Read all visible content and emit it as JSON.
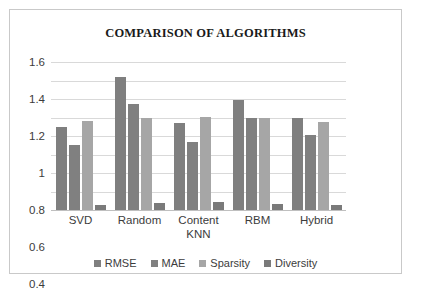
{
  "chart_data": {
    "type": "bar",
    "title": "COMPARISON OF ALGORITHMS",
    "xlabel": "",
    "ylabel": "",
    "ylim": [
      0,
      1.6
    ],
    "grid": true,
    "legend_position": "bottom",
    "categories": [
      "SVD",
      "Random",
      "Content KNN",
      "RBM",
      "Hybrid"
    ],
    "category_lines": [
      [
        "SVD"
      ],
      [
        "Random"
      ],
      [
        "Content",
        "KNN"
      ],
      [
        "RBM"
      ],
      [
        "Hybrid"
      ]
    ],
    "ytick_labels": [
      "1.6",
      "1.4",
      "1.2",
      "1",
      "0.8",
      "0.6",
      "0.4",
      "0.2",
      "0"
    ],
    "ytick_values": [
      1.6,
      1.4,
      1.2,
      1.0,
      0.8,
      0.6,
      0.4,
      0.2,
      0
    ],
    "series": [
      {
        "name": "RMSE",
        "color": "#7f7f7f",
        "values": [
          0.9,
          1.44,
          0.94,
          1.19,
          1.0
        ]
      },
      {
        "name": "MAE",
        "color": "#808080",
        "values": [
          0.7,
          1.15,
          0.73,
          1.0,
          0.81
        ]
      },
      {
        "name": "Sparsity",
        "color": "#a6a6a6",
        "values": [
          0.96,
          1.0,
          1.01,
          1.0,
          0.95
        ]
      },
      {
        "name": "Diversity",
        "color": "#7a7a7a",
        "values": [
          0.05,
          0.08,
          0.09,
          0.06,
          0.05
        ]
      }
    ]
  }
}
